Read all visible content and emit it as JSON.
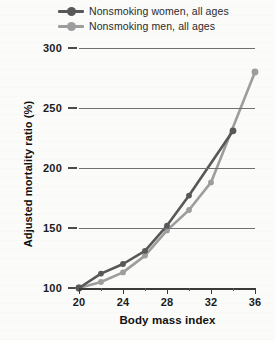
{
  "chart_data": {
    "type": "line",
    "title": "",
    "xlabel": "Body mass index",
    "ylabel": "Adjusted mortality ratio (%)",
    "xlim": [
      18.5,
      36.5
    ],
    "ylim": [
      90,
      305
    ],
    "xticks": [
      20,
      24,
      28,
      32,
      36
    ],
    "xtick_labels": [
      "20",
      "24",
      "28",
      "32",
      "36"
    ],
    "x_minor_ticks": [
      22,
      26,
      30,
      34
    ],
    "yticks": [
      100,
      150,
      200,
      250,
      300
    ],
    "ytick_labels": [
      "100",
      "150",
      "200",
      "250",
      "300"
    ],
    "grid": "horizontal",
    "legend_position": "top",
    "series": [
      {
        "name": "Nonsmoking women, all ages",
        "color": "#585858",
        "marker": "circle",
        "x": [
          20,
          22,
          24,
          26,
          28,
          30,
          34
        ],
        "values": [
          100,
          112,
          120,
          131,
          152,
          177,
          231
        ]
      },
      {
        "name": "Nonsmoking men, all ages",
        "color": "#9d9d9d",
        "marker": "circle",
        "x": [
          20,
          22,
          24,
          26,
          28,
          30,
          32,
          36
        ],
        "values": [
          100,
          105,
          113,
          127,
          148,
          165,
          188,
          280
        ]
      }
    ]
  },
  "legend": {
    "items": [
      {
        "label": "Nonsmoking women, all ages",
        "color": "#585858"
      },
      {
        "label": "Nonsmoking men, all ages",
        "color": "#9d9d9d"
      }
    ]
  },
  "axes": {
    "x_title": "Body mass index",
    "y_title": "Adjusted mortality ratio (%)",
    "y_labels": [
      "300",
      "250",
      "200",
      "150",
      "100"
    ],
    "x_labels": [
      "20",
      "24",
      "28",
      "32",
      "36"
    ]
  }
}
